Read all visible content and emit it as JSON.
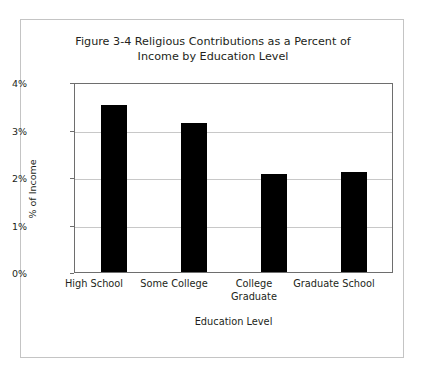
{
  "chart_data": {
    "type": "bar",
    "title": "Figure 3-4 Religious Contributions as a Percent of Income by Education Level",
    "title_lines": [
      "Figure 3-4 Religious Contributions as a Percent of",
      "Income by Education Level"
    ],
    "xlabel": "Education Level",
    "ylabel": "% of Income",
    "categories": [
      "High School",
      "Some College",
      "College Graduate",
      "Graduate School"
    ],
    "category_lines": [
      [
        "High School"
      ],
      [
        "Some College"
      ],
      [
        "College",
        "Graduate"
      ],
      [
        "Graduate School"
      ]
    ],
    "values": [
      3.55,
      3.18,
      2.08,
      2.12
    ],
    "ylim": [
      0,
      4
    ],
    "ytick_values": [
      0,
      1,
      2,
      3,
      4
    ],
    "ytick_labels": [
      "0%",
      "1%",
      "2%",
      "3%",
      "4%"
    ],
    "grid": "horizontal",
    "legend": "none",
    "bar_color": "#000000",
    "gridline_color": "#c8c8c8",
    "axis_color": "#6e6e6e",
    "frame_color": "#c4c4c4",
    "background_color": "#ffffff"
  }
}
